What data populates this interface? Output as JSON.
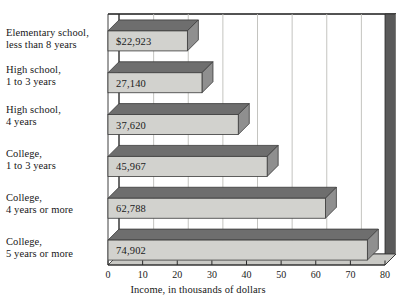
{
  "chart_data": {
    "type": "bar",
    "orientation": "horizontal",
    "title": "",
    "xlabel": "Income, in thousands of dollars",
    "ylabel": "",
    "xlim": [
      0,
      80
    ],
    "xticks": [
      0,
      10,
      20,
      30,
      40,
      50,
      60,
      70,
      80
    ],
    "grid": true,
    "legend": false,
    "style": "3d-horizontal-bars",
    "categories": [
      "Elementary school, less than 8 years",
      "High school, 1 to 3 years",
      "High school, 4 years",
      "College, 1 to 3 years",
      "College, 4 years or more",
      "College, 5 years or more"
    ],
    "category_lines": [
      [
        "Elementary school,",
        "less than 8 years"
      ],
      [
        "High school,",
        "1 to 3 years"
      ],
      [
        "High school,",
        "4 years"
      ],
      [
        "College,",
        "1 to 3 years"
      ],
      [
        "College,",
        "4 years or more"
      ],
      [
        "College,",
        "5 years or more"
      ]
    ],
    "values": [
      22.923,
      27.14,
      37.62,
      45.967,
      62.788,
      74.902
    ],
    "data_labels": [
      "$22,923",
      "27,140",
      "37,620",
      "45,967",
      "62,788",
      "74,902"
    ],
    "units": "thousands of dollars"
  },
  "colors": {
    "bar_front": "#d2d2ce",
    "bar_top": "#6e6e6e",
    "bar_side": "#8f8f8f",
    "wall_back": "#ffffff",
    "wall_top": "#cfcfcb",
    "wall_right": "#5a5a5a",
    "floor": "#c9c9c5",
    "gridline": "#bdbdb9",
    "axis": "#2a2a2a",
    "text": "#1a1a1a"
  },
  "axis": {
    "tick_labels": [
      "0",
      "10",
      "20",
      "30",
      "40",
      "50",
      "60",
      "70",
      "80"
    ],
    "title": "Income, in thousands of dollars"
  }
}
